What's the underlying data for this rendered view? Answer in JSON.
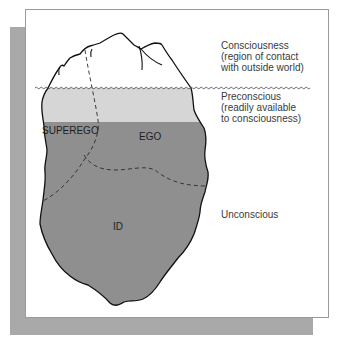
{
  "diagram": {
    "levels": {
      "conscious": {
        "lines": [
          "Consciousness",
          "(region of contact",
          "with outside world)"
        ]
      },
      "preconscious": {
        "lines": [
          "Preconscious",
          "(readily available",
          "to consciousness)"
        ]
      },
      "unconscious": {
        "lines": [
          "Unconscious"
        ]
      }
    },
    "structures": {
      "superego": "SUPEREGO",
      "ego": "EGO",
      "id": "ID"
    },
    "colors": {
      "shadow": "#a9a9a9",
      "panel_border": "#9a9a9a",
      "above_water": "#ffffff",
      "preconscious_fill": "#d6d6d6",
      "unconscious_fill": "#8f8f8f",
      "outline": "#111111",
      "text": "#3a3a3a"
    }
  }
}
